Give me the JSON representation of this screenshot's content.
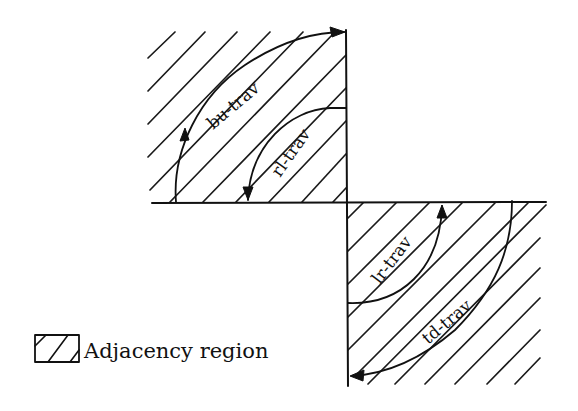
{
  "diagram": {
    "labels": {
      "bu": "bu-trav",
      "rl": "rl-trav",
      "lr": "lr-trav",
      "td": "td-trav"
    },
    "legend": {
      "text": "Adjacency region"
    },
    "colors": {
      "ink": "#111111",
      "background": "#ffffff"
    }
  }
}
